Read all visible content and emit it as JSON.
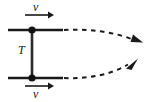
{
  "figure": {
    "name": "rod-with-velocity-vectors-diagram",
    "background_color": "#ffffff",
    "stroke_color": "#1a1a1a",
    "width": 151,
    "height": 102
  },
  "labels": {
    "velocity_top": "v",
    "velocity_bottom": "v",
    "tension": "T"
  },
  "elements": {
    "top_rail_label": "top-horizontal-rod",
    "bottom_rail_label": "bottom-horizontal-rod",
    "connector_label": "vertical-connector-bar",
    "top_node_label": "top-pivot-point",
    "bottom_node_label": "bottom-pivot-point",
    "top_velocity_arrow_label": "top-velocity-arrow",
    "bottom_velocity_arrow_label": "bottom-velocity-arrow",
    "top_trajectory_label": "top-dashed-trajectory-arrow",
    "bottom_trajectory_label": "bottom-dashed-trajectory-arrow"
  },
  "geometry": {
    "top_rail_y": 30,
    "bottom_rail_y": 78,
    "rail_x_start": 8,
    "rail_x_end": 62,
    "node_x": 32,
    "top_velocity_arrow_y": 15,
    "bottom_velocity_arrow_y": 86,
    "velocity_arrow_x_start": 25,
    "velocity_arrow_x_end": 52,
    "top_arrowhead": [
      141,
      41
    ],
    "bottom_arrowhead": [
      136,
      61
    ]
  }
}
